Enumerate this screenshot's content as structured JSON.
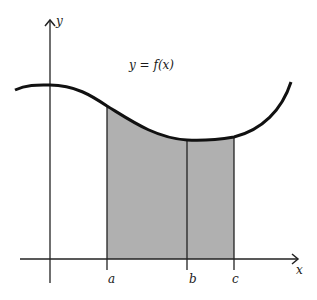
{
  "figure": {
    "type": "area-under-curve",
    "axes": {
      "x_label": "x",
      "y_label": "y"
    },
    "curve_label": "y = f(x)",
    "ticks": [
      {
        "label": "a"
      },
      {
        "label": "b"
      },
      {
        "label": "c"
      }
    ],
    "colors": {
      "curve": "#111111",
      "axes": "#222222",
      "shaded_region": "#b0b0b0",
      "background": "#ffffff"
    },
    "shaded_interval": [
      "a",
      "c"
    ],
    "divider_at": "b"
  }
}
